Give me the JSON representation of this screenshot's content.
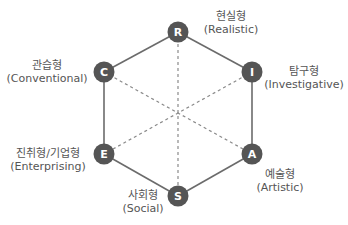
{
  "diagram": {
    "type": "holland-riasec-hexagon",
    "colors": {
      "node": "#555555",
      "edge": "#666666",
      "node_text": "#ffffff",
      "label_text": "#555555"
    },
    "nodes": [
      {
        "letter": "R",
        "korean": "현실형",
        "english": "(Realistic)"
      },
      {
        "letter": "I",
        "korean": "탐구형",
        "english": "(Investigative)"
      },
      {
        "letter": "A",
        "korean": "예술형",
        "english": "(Artistic)"
      },
      {
        "letter": "S",
        "korean": "사회형",
        "english": "(Social)"
      },
      {
        "letter": "E",
        "korean": "진취형/기업형",
        "english": "(Enterprising)"
      },
      {
        "letter": "C",
        "korean": "관습형",
        "english": "(Conventional)"
      }
    ],
    "edges_solid": [
      "R-I",
      "I-A",
      "A-S",
      "S-E",
      "E-C",
      "C-R"
    ],
    "edges_dashed": [
      "R-S",
      "I-E",
      "C-A"
    ]
  }
}
